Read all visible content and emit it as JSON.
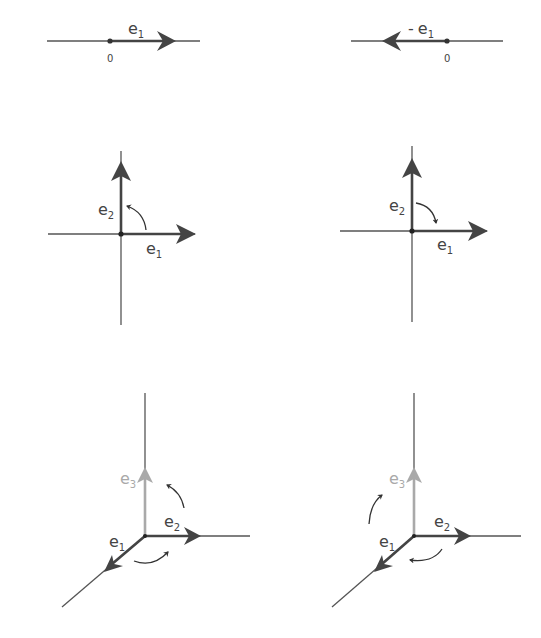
{
  "colors": {
    "axis": "#555555",
    "vector": "#444444",
    "e3_vector": "#a9a9a9",
    "text": "#444444",
    "background": "#ffffff"
  },
  "panels": [
    {
      "id": "1d-positive",
      "labels": {
        "vector": "e",
        "vector_sub": "1",
        "origin": "0"
      }
    },
    {
      "id": "1d-negative",
      "labels": {
        "prefix": "-",
        "vector": "e",
        "vector_sub": "1",
        "origin": "0"
      }
    },
    {
      "id": "2d-counterclockwise",
      "labels": {
        "e1": "e",
        "e1_sub": "1",
        "e2": "e",
        "e2_sub": "2"
      },
      "rotation": "counterclockwise"
    },
    {
      "id": "2d-clockwise",
      "labels": {
        "e1": "e",
        "e1_sub": "1",
        "e2": "e",
        "e2_sub": "2"
      },
      "rotation": "clockwise"
    },
    {
      "id": "3d-right-handed",
      "labels": {
        "e1": "e",
        "e1_sub": "1",
        "e2": "e",
        "e2_sub": "2",
        "e3": "e",
        "e3_sub": "3"
      },
      "rotation": "counterclockwise"
    },
    {
      "id": "3d-left-handed",
      "labels": {
        "e1": "e",
        "e1_sub": "1",
        "e2": "e",
        "e2_sub": "2",
        "e3": "e",
        "e3_sub": "3"
      },
      "rotation": "clockwise"
    }
  ]
}
